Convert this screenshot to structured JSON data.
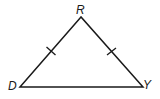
{
  "diagram": {
    "type": "isosceles-triangle",
    "vertices": [
      {
        "label": "R",
        "x": 81,
        "y": 17
      },
      {
        "label": "D",
        "x": 20,
        "y": 87
      },
      {
        "label": "Y",
        "x": 143,
        "y": 87
      }
    ],
    "labels": {
      "R": "R",
      "D": "D",
      "Y": "Y"
    },
    "congruent_sides": [
      "RD",
      "RY"
    ],
    "tick_marks": 1,
    "stroke_color": "#1a1a1a"
  }
}
